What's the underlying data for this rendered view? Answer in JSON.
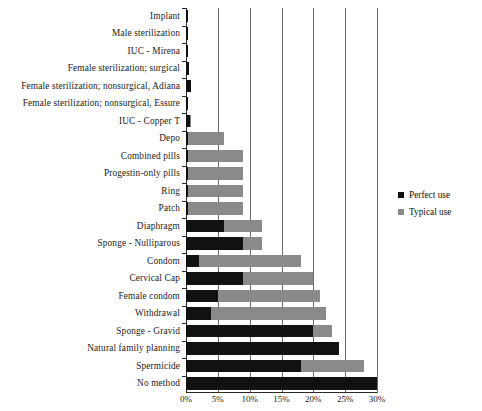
{
  "chart_data": {
    "type": "bar",
    "orientation": "horizontal",
    "title": "",
    "xlabel": "",
    "ylabel": "",
    "xlim": [
      0,
      30
    ],
    "xunit": "%",
    "xticks": [
      "0%",
      "5%",
      "10%",
      "15%",
      "20%",
      "25%",
      "30%"
    ],
    "xtick_values": [
      0,
      5,
      10,
      15,
      20,
      25,
      30
    ],
    "grid": true,
    "legend_position": "right",
    "categories": [
      "Implant",
      "Male sterilization",
      "IUC - Mirena",
      "Female sterilization; surgical",
      "Female sterilization; nonsurgical, Adiana",
      "Female sterilization; nonsurgical, Essure",
      "IUC - Copper T",
      "Depo",
      "Combined pills",
      "Progestin-only pills",
      "Ring",
      "Patch",
      "Diaphragm",
      "Sponge - Nulliparous",
      "Condom",
      "Cervical Cap",
      "Female condom",
      "Withdrawal",
      "Sponge - Gravid",
      "Natural family planning",
      "Spermicide",
      "No method"
    ],
    "series": [
      {
        "name": "Perfect use",
        "color": "#111111",
        "values": [
          0.05,
          0.1,
          0.2,
          0.5,
          0.8,
          0.3,
          0.6,
          0.2,
          0.3,
          0.3,
          0.3,
          0.3,
          6,
          9,
          2,
          9,
          5,
          4,
          20,
          24,
          18,
          30
        ]
      },
      {
        "name": "Typical use",
        "color": "#8a8a8a",
        "values": [
          0.05,
          0.15,
          0.2,
          0.5,
          0.8,
          0.3,
          0.8,
          6,
          9,
          9,
          9,
          9,
          12,
          12,
          18,
          20,
          21,
          22,
          23,
          24,
          28,
          30
        ]
      }
    ]
  },
  "legend": {
    "items": [
      {
        "label": "Perfect use",
        "color": "#111111"
      },
      {
        "label": "Typical use",
        "color": "#8a8a8a"
      }
    ]
  }
}
